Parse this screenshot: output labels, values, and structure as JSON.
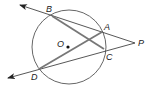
{
  "diagram": {
    "type": "circle-secants",
    "circle": {
      "center_label": "O",
      "cx": 69,
      "cy": 47,
      "r": 37
    },
    "points": [
      {
        "id": "B",
        "label": "B",
        "x": 52,
        "y": 16,
        "lx": 46,
        "ly": 12
      },
      {
        "id": "A",
        "label": "A",
        "x": 102,
        "y": 32,
        "lx": 104,
        "ly": 30
      },
      {
        "id": "C",
        "label": "C",
        "x": 104,
        "y": 49,
        "lx": 106,
        "ly": 60
      },
      {
        "id": "D",
        "label": "D",
        "x": 39,
        "y": 69,
        "lx": 31,
        "ly": 80
      },
      {
        "id": "P",
        "label": "P",
        "x": 135,
        "y": 43,
        "lx": 138,
        "ly": 46
      },
      {
        "id": "O",
        "label": "O",
        "x": 68,
        "y": 47,
        "lx": 57,
        "ly": 47
      }
    ],
    "secants": [
      {
        "from": "P",
        "through": [
          "A",
          "B"
        ],
        "arrow_end": {
          "x": 20,
          "y": 5
        }
      },
      {
        "from": "P",
        "through": [
          "C",
          "D"
        ],
        "arrow_end": {
          "x": 8,
          "y": 78
        }
      }
    ],
    "chords": [
      {
        "from": "B",
        "to": "C"
      },
      {
        "from": "D",
        "to": "A"
      }
    ],
    "colors": {
      "circle": "#666666",
      "secant": "#444444",
      "chord": "#777777",
      "label": "#222222"
    }
  }
}
